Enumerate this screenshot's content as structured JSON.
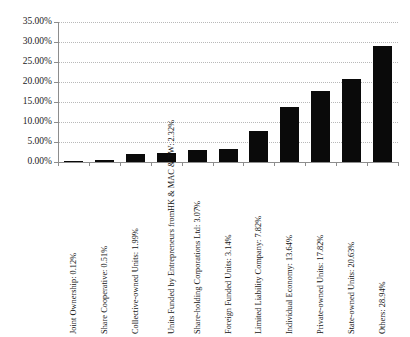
{
  "chart_data": {
    "type": "bar",
    "title": "",
    "subtitle": "",
    "xlabel": "",
    "ylabel": "",
    "ylim": [
      0,
      35
    ],
    "grid": true,
    "legend": false,
    "orientation": "vertical",
    "bar_color": "#0a0a0a",
    "gridline_color": "#b9b9b9",
    "axis_color": "#8d8d8d",
    "ytick_labels": [
      "0.00%",
      "5.00%",
      "10.00%",
      "15.00%",
      "20.00%",
      "25.00%",
      "30.00%",
      "35.00%"
    ],
    "ytick_values": [
      0,
      5,
      10,
      15,
      20,
      25,
      30,
      35
    ],
    "categories": [
      "Joint Ownership",
      "Share Cooperative",
      "Collective-owned Units",
      "Units Funded by Entrepreneurs from HK & MAC & TW",
      "Share-holding Corporations Ltd",
      "Foreign Funded Units",
      "Limited Liability Company",
      "Individual Economy",
      "Private-owned Units",
      "State-owned Units",
      "Others"
    ],
    "values": [
      0.12,
      0.51,
      1.99,
      2.32,
      3.07,
      3.14,
      7.82,
      13.64,
      17.82,
      20.63,
      28.94
    ],
    "tick_labels": [
      "Joint Ownership: 0.12%",
      "Share Cooperative: 0.51%",
      "Collective-owned Units: 1.99%",
      "Units Funded by Entrepreneurs from HK & MAC & TW: 2.32%",
      "Share-holding Corporations Ltd: 3.07%",
      "Foreign Funded Units: 3.14%",
      "Limited Liability Company: 7.82%",
      "Individual Economy: 13.64%",
      "Private-owned Units: 17.82%",
      "State-owned Units: 20.63%",
      "Others: 28.94%"
    ],
    "tick_label_lines": [
      [
        "Joint Ownership: 0.12%"
      ],
      [
        "Share Cooperative: 0.51%"
      ],
      [
        "Collective-owned Units: 1.99%"
      ],
      [
        "Units Funded by Entrepreneurs from",
        "HK & MAC & TW: 2.32%"
      ],
      [
        "Share-holding Corporations Ltd: 3.07%"
      ],
      [
        "Foreign Funded Units: 3.14%"
      ],
      [
        "Limited Liability Company: 7.82%"
      ],
      [
        "Individual Economy: 13.64%"
      ],
      [
        "Private-owned Units: 17.82%"
      ],
      [
        "State-owned Units: 20.63%"
      ],
      [
        "Others: 28.94%"
      ]
    ]
  }
}
